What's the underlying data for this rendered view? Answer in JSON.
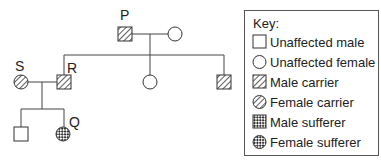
{
  "diagram": {
    "type": "pedigree",
    "individuals": [
      {
        "label": "P",
        "sex": "male",
        "status": "carrier"
      },
      {
        "label": "",
        "sex": "female",
        "status": "unaffected"
      },
      {
        "label": "R",
        "sex": "male",
        "status": "carrier"
      },
      {
        "label": "",
        "sex": "female",
        "status": "unaffected"
      },
      {
        "label": "",
        "sex": "male",
        "status": "carrier"
      },
      {
        "label": "S",
        "sex": "female",
        "status": "carrier"
      },
      {
        "label": "",
        "sex": "male",
        "status": "unaffected"
      },
      {
        "label": "Q",
        "sex": "female",
        "status": "sufferer"
      }
    ],
    "labels": {
      "p": "P",
      "r": "R",
      "s": "S",
      "q": "Q"
    }
  },
  "key": {
    "title": "Key:",
    "items": [
      {
        "symbol": "square-empty",
        "label": "Unaffected male"
      },
      {
        "symbol": "circle-empty",
        "label": "Unaffected female"
      },
      {
        "symbol": "square-hatched",
        "label": "Male carrier"
      },
      {
        "symbol": "circle-hatched",
        "label": "Female carrier"
      },
      {
        "symbol": "square-checkered",
        "label": "Male sufferer"
      },
      {
        "symbol": "circle-checkered",
        "label": "Female sufferer"
      }
    ]
  }
}
